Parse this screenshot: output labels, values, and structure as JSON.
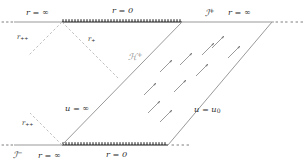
{
  "figure": {
    "type": "conformal-penrose-diagram",
    "background_color": "#ffffff",
    "line_color_solid": "#4a4a4a",
    "line_color_gray": "#9a9a9a",
    "line_color_dashed": "#b9b9b9",
    "singularity_color": "#1a1a1a",
    "text_color": "#2b2b2b"
  },
  "labels": {
    "top_left_r_infinity": "r = ∞",
    "top_center_r_zero": "r = 0",
    "top_right_scri_plus": "ℐ",
    "top_right_scri_plus_sup": "+",
    "top_right_r_infinity": "r = ∞",
    "left_upper_r_plus": "r",
    "left_upper_r_plus_sub": "++",
    "inner_r_plus": "r",
    "inner_r_plus_sub": "+",
    "horizon": "ℋ",
    "horizon_sup": "+",
    "u_equals_infinity": "u = ∞",
    "u_equals_u0": "u = u",
    "u_equals_u0_sub": "0",
    "left_lower_r_plus": "r",
    "left_lower_r_plus_sub": "++",
    "bottom_left_scri_minus": "ℐ",
    "bottom_left_scri_minus_sup": "−",
    "bottom_left_r_infinity": "r = ∞",
    "bottom_center_r_zero": "r = 0"
  },
  "geometry": {
    "top_axis_y": 22,
    "bottom_axis_y": 145,
    "top_singularity_x0": 62,
    "top_singularity_x1": 182,
    "bottom_singularity_x0": 62,
    "bottom_singularity_x1": 168,
    "left_axis_x0": 15,
    "right_axis_x1": 272
  },
  "arrows": {
    "direction": "up-right",
    "count": 10,
    "description": "outgoing null ray arrows in exterior region"
  }
}
